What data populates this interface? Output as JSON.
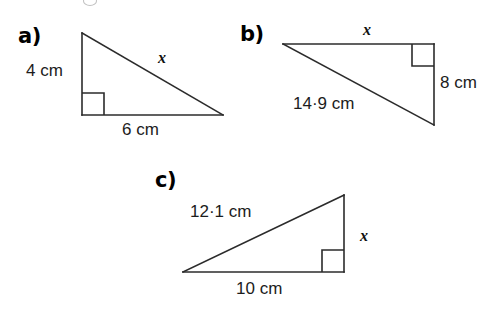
{
  "page": {
    "background_color": "#ffffff",
    "line_color": "#2b2b2b",
    "text_color": "#1a1a1a"
  },
  "figures": [
    {
      "id": "a",
      "letter": "a)",
      "description": "right-angled triangle with vertical leg 4 cm, horizontal leg 6 cm and hypotenuse x",
      "labels": {
        "vertical_leg": "4 cm",
        "horizontal_leg": "6 cm",
        "hypotenuse": "x"
      },
      "right_angle": "between vertical leg and horizontal leg"
    },
    {
      "id": "b",
      "letter": "b)",
      "description": "right-angled triangle with horizontal leg x, vertical leg 8 cm and hypotenuse 14·9 cm",
      "labels": {
        "horizontal_leg": "x",
        "vertical_leg": "8 cm",
        "hypotenuse": "14·9 cm"
      },
      "right_angle": "between horizontal leg and vertical leg"
    },
    {
      "id": "c",
      "letter": "c)",
      "description": "right-angled triangle with hypotenuse 12·1 cm, horizontal leg 10 cm and vertical leg x",
      "labels": {
        "hypotenuse": "12·1 cm",
        "horizontal_leg": "10 cm",
        "vertical_leg": "x"
      },
      "right_angle": "between horizontal leg and vertical leg"
    }
  ]
}
